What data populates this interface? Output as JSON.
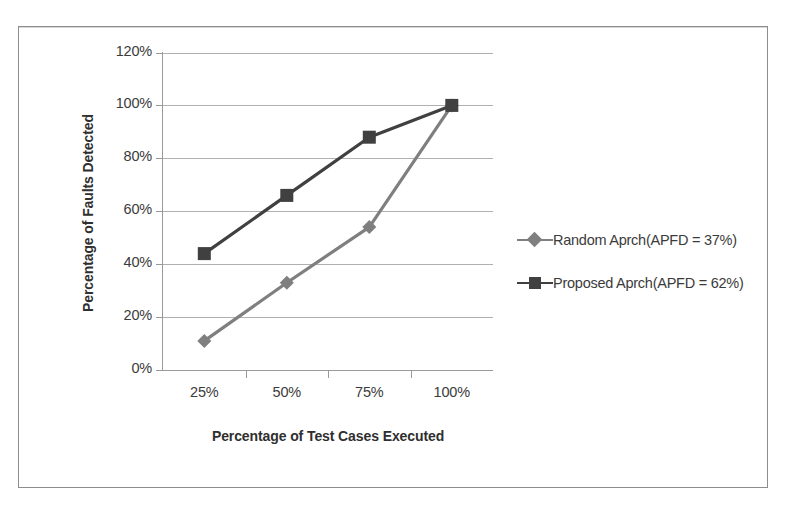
{
  "chart_data": {
    "type": "line",
    "title": "",
    "xlabel": "Percentage of Test Cases Executed",
    "ylabel": "Percentage of Faults Detected",
    "categories": [
      "25%",
      "50%",
      "75%",
      "100%"
    ],
    "x_tick_labels": [
      "25%",
      "50%",
      "75%",
      "100%"
    ],
    "y_tick_labels": [
      "0%",
      "20%",
      "40%",
      "60%",
      "80%",
      "100%",
      "120%"
    ],
    "y_tick_values": [
      0,
      20,
      40,
      60,
      80,
      100,
      120
    ],
    "ylim": [
      0,
      120
    ],
    "grid": "horizontal",
    "legend_position": "right",
    "series": [
      {
        "name": "Random Aprch(APFD = 37%)",
        "marker": "diamond",
        "color": "#7f7f7f",
        "values": [
          11,
          33,
          54,
          100
        ]
      },
      {
        "name": "Proposed Aprch(APFD = 62%)",
        "marker": "square",
        "color": "#404040",
        "values": [
          44,
          66,
          88,
          100
        ]
      }
    ]
  },
  "legend": {
    "items": [
      {
        "label": "Random Aprch(APFD = 37%)"
      },
      {
        "label": "Proposed Aprch(APFD = 62%)"
      }
    ]
  },
  "colors": {
    "random_series": "#7f7f7f",
    "proposed_series": "#404040",
    "gridline": "#b0b0b0",
    "axis": "#9a9a9a",
    "frame": "#8d8d8d",
    "text": "#3b3b3b"
  }
}
